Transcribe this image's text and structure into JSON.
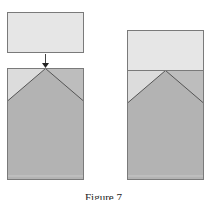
{
  "figure": {
    "caption": "Figure 7",
    "colors": {
      "top_block": "#e6e6e6",
      "side_triangle_left": "#dcdcdc",
      "side_triangle_right": "#bdbdbd",
      "wedge_body": "#b3b3b3",
      "outline": "#7a7a7a",
      "arrow": "#333333"
    },
    "panels": [
      {
        "name": "before",
        "has_arrow": true,
        "top_block_attached": false
      },
      {
        "name": "after",
        "has_arrow": false,
        "top_block_attached": true
      }
    ]
  }
}
